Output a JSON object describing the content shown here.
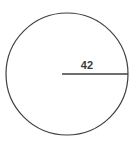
{
  "figure": {
    "kind": "geometry-diagram",
    "shape": "circle",
    "background_color": "#ffffff",
    "stroke_color": "#3f3f3f",
    "label_color": "#3b3b3b",
    "circle": {
      "center_x": 67,
      "center_y": 74,
      "radius": 61,
      "stroke_width": 1.2
    },
    "radius_segment": {
      "name": "radius",
      "from_x": 62,
      "from_y": 74,
      "to_x": 128,
      "to_y": 74,
      "stroke_width": 1.4,
      "label": "42"
    },
    "labels": {
      "radius_value": "42"
    }
  }
}
